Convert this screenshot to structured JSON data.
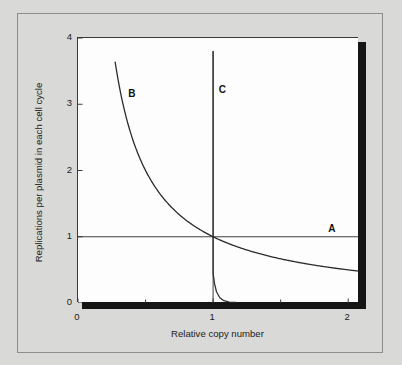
{
  "figure": {
    "background_color": "#d9d9d7",
    "plot_background_color": "#fdfdfd",
    "border_color": "#8e8e8c",
    "shadow_color": "#151515",
    "curve_color": "#2b2b2b"
  },
  "chart_data": {
    "type": "line",
    "title": "",
    "xlabel": "Relative copy number",
    "ylabel": "Replications per plasmid in each cell cycle",
    "xlim": [
      0,
      2.08
    ],
    "ylim": [
      0,
      4
    ],
    "xticks": [
      0,
      1,
      2
    ],
    "xtick_labels": [
      "0",
      "1",
      "2"
    ],
    "x_minor_ticks": [
      0.5,
      1.5
    ],
    "yticks": [
      0,
      1,
      2,
      3,
      4
    ],
    "ytick_labels": [
      "0",
      "1",
      "2",
      "3",
      "4"
    ],
    "grid": false,
    "legend": "none",
    "series": [
      {
        "name": "A",
        "label": "A",
        "description": "Horizontal line at y = 1 (constant replication rate, copy-number independent)",
        "shape": "horizontal-line",
        "y_value": 1,
        "x_range": [
          0,
          2.08
        ],
        "points": [
          [
            0,
            1
          ],
          [
            2.08,
            1
          ]
        ]
      },
      {
        "name": "B",
        "label": "B",
        "description": "Inverse hyperbola y = 1/x, gradual negative feedback passing through (1,1)",
        "shape": "hyperbola",
        "formula": "y = 1/x",
        "x_range": [
          0.275,
          2.08
        ],
        "points": [
          [
            0.275,
            3.58
          ],
          [
            0.32,
            3.12
          ],
          [
            0.38,
            2.63
          ],
          [
            0.45,
            2.22
          ],
          [
            0.55,
            1.82
          ],
          [
            0.65,
            1.54
          ],
          [
            0.75,
            1.33
          ],
          [
            0.85,
            1.18
          ],
          [
            1.0,
            1.0
          ],
          [
            1.15,
            0.87
          ],
          [
            1.3,
            0.77
          ],
          [
            1.5,
            0.67
          ],
          [
            1.7,
            0.6
          ],
          [
            1.9,
            0.545
          ],
          [
            2.08,
            0.52
          ]
        ]
      },
      {
        "name": "C",
        "label": "C",
        "description": "Near-vertical step at x = 1, sharp all-or-none negative feedback",
        "shape": "step",
        "x_value": 1,
        "y_range": [
          0,
          3.8
        ],
        "points": [
          [
            1.0,
            3.8
          ],
          [
            1.0,
            1.0
          ],
          [
            1.0,
            0.45
          ],
          [
            1.01,
            0.3
          ],
          [
            1.025,
            0.17
          ],
          [
            1.05,
            0.08
          ],
          [
            1.08,
            0.035
          ],
          [
            1.12,
            0.015
          ],
          [
            1.17,
            0.008
          ]
        ]
      }
    ],
    "annotations": [
      {
        "text": "A",
        "x": 1.86,
        "y": 1.17
      },
      {
        "text": "B",
        "x": 0.38,
        "y": 3.22
      },
      {
        "text": "C",
        "x": 1.05,
        "y": 3.27
      }
    ]
  }
}
